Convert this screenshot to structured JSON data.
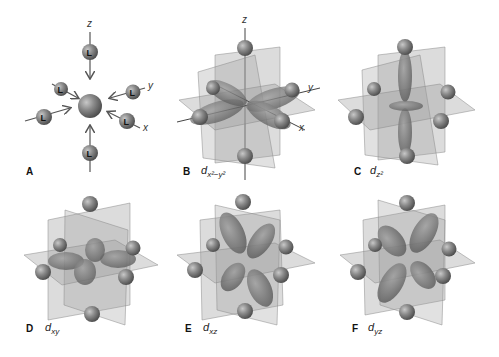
{
  "figure": {
    "panels": [
      {
        "id": "A",
        "label": "A",
        "orbital": "",
        "description": "Octahedral ligand approach"
      },
      {
        "id": "B",
        "label": "B",
        "orbital": "d",
        "subscript": "x²−y²"
      },
      {
        "id": "C",
        "label": "C",
        "orbital": "d",
        "subscript": "z²"
      },
      {
        "id": "D",
        "label": "D",
        "orbital": "d",
        "subscript": "xy"
      },
      {
        "id": "E",
        "label": "E",
        "orbital": "d",
        "subscript": "xz"
      },
      {
        "id": "F",
        "label": "F",
        "orbital": "d",
        "subscript": "yz"
      }
    ],
    "axes": {
      "x": "x",
      "y": "y",
      "z": "z"
    },
    "ligand_symbol": "L",
    "colors": {
      "ligand_sphere": "#7a7a7a",
      "metal_sphere": "#808080",
      "plane": "#9a9a9a",
      "orbital_lobe": "#777777",
      "arrow": "#555555",
      "background": "#ffffff"
    }
  }
}
